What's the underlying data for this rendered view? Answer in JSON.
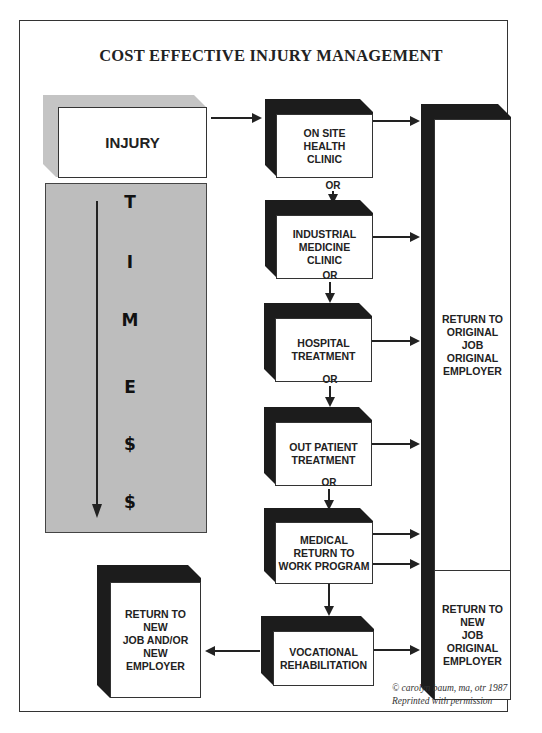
{
  "title": "COST EFFECTIVE INJURY MANAGEMENT",
  "start": {
    "label": "INJURY"
  },
  "time_axis": {
    "letters": [
      "T",
      "I",
      "M",
      "E",
      "$",
      "$"
    ],
    "direction": "down"
  },
  "connector_label": "OR",
  "steps": [
    {
      "label": "ON SITE\nHEALTH\nCLINIC"
    },
    {
      "label": "INDUSTRIAL\nMEDICINE\nCLINIC"
    },
    {
      "label": "HOSPITAL\nTREATMENT"
    },
    {
      "label": "OUT PATIENT\nTREATMENT"
    },
    {
      "label": "MEDICAL\nRETURN TO\nWORK PROGRAM"
    },
    {
      "label": "VOCATIONAL\nREHABILITATION"
    }
  ],
  "outcomes": {
    "original": {
      "label": "RETURN TO\nORIGINAL\nJOB\nORIGINAL\nEMPLOYER"
    },
    "new_job": {
      "label": "RETURN TO\nNEW\nJOB\nORIGINAL\nEMPLOYER"
    },
    "new_employer": {
      "label": "RETURN TO\nNEW\nJOB AND/OR\nNEW\nEMPLOYER"
    }
  },
  "credit": "© carolyn baum, ma, otr 1987\nReprinted with permission"
}
